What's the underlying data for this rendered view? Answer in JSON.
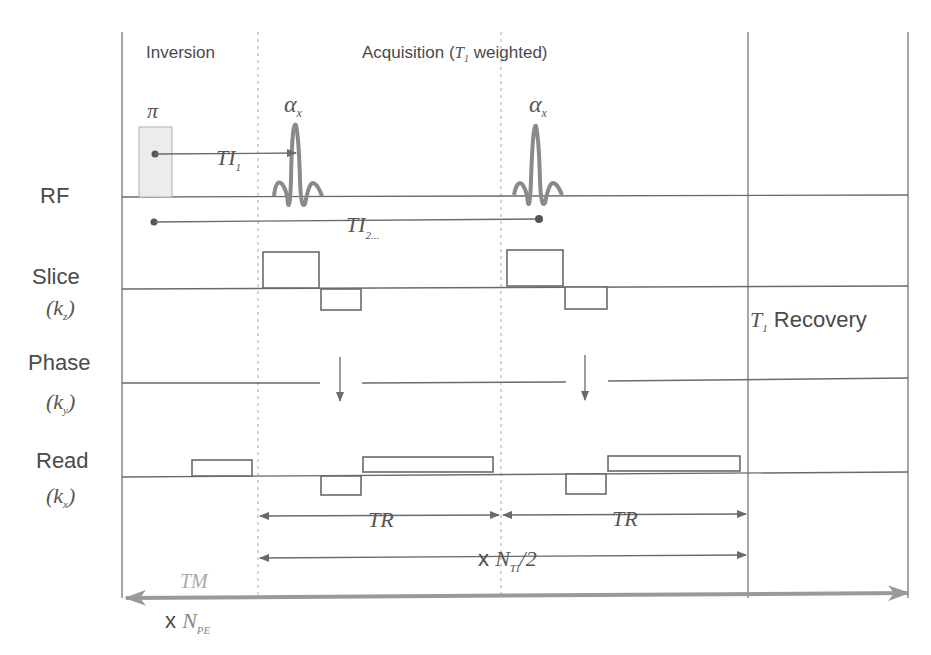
{
  "sections": {
    "inversion": "Inversion",
    "acquisition_prefix": "Acquisition (",
    "acquisition_T": "T",
    "acquisition_sub": "1",
    "acquisition_suffix": " weighted)"
  },
  "rows": {
    "rf": {
      "label": "RF"
    },
    "slice": {
      "label": "Slice",
      "k_open": "(k",
      "k_sub": "z",
      "k_close": ")"
    },
    "phase": {
      "label": "Phase",
      "k_open": "(k",
      "k_sub": "y",
      "k_close": ")"
    },
    "read": {
      "label": "Read",
      "k_open": "(k",
      "k_sub": "x",
      "k_close": ")"
    }
  },
  "pulses": {
    "inversion_symbol": "π",
    "alpha_symbol": "α",
    "alpha_sub": "x"
  },
  "timings": {
    "ti1": "TI",
    "ti1_sub": "1",
    "ti2": "TI",
    "ti2_sub": "2...",
    "tr1": "TR",
    "tr2": "TR",
    "nti_prefix": "x ",
    "nti": "N",
    "nti_sub": "TI",
    "nti_suffix": "/2",
    "tm": "TM",
    "npe_prefix": "x ",
    "npe": "N",
    "npe_sub": "PE"
  },
  "recovery": {
    "t": "T",
    "t_sub": "1",
    "label": " Recovery"
  },
  "colors": {
    "line": "#6a6a6a",
    "text": "#4a4a4a",
    "pulse": "#8a8a8a",
    "inversion_fill": "#ececec",
    "tm_arrow": "#9a9a9a"
  }
}
